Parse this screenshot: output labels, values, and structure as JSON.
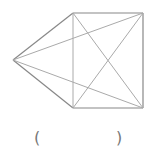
{
  "diagram": {
    "type": "geometry-figure",
    "points": {
      "A": [
        13,
        60
      ],
      "B": [
        73,
        13
      ],
      "C": [
        143,
        13
      ],
      "D": [
        143,
        108
      ],
      "E": [
        73,
        108
      ]
    },
    "outline_segments": [
      [
        "A",
        "B"
      ],
      [
        "B",
        "C"
      ],
      [
        "C",
        "D"
      ],
      [
        "D",
        "E"
      ],
      [
        "E",
        "A"
      ]
    ],
    "inner_segments": [
      [
        "B",
        "E"
      ],
      [
        "B",
        "D"
      ],
      [
        "C",
        "E"
      ],
      [
        "A",
        "C"
      ],
      [
        "A",
        "D"
      ]
    ],
    "colors": {
      "outline": "#888888",
      "inner": "#aaaaaa"
    }
  },
  "answer_blank": {
    "left": "(",
    "right": ")"
  }
}
